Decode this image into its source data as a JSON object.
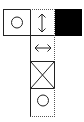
{
  "diagram": {
    "cells": [
      {
        "id": "left",
        "icon": "circle-icon",
        "fill": "#ffffff"
      },
      {
        "id": "top-center",
        "icon": "vertical-double-arrow-icon",
        "fill": "#ffffff"
      },
      {
        "id": "right",
        "icon": "none",
        "fill": "#000000"
      },
      {
        "id": "center-2",
        "icon": "horizontal-double-arrow-icon",
        "fill": "#ffffff"
      },
      {
        "id": "center-3",
        "icon": "cross-box-icon",
        "fill": "#ffffff"
      },
      {
        "id": "center-4",
        "icon": "circle-icon",
        "fill": "#ffffff"
      }
    ],
    "colors": {
      "line": "#222222",
      "black": "#000000",
      "background": "#ffffff"
    }
  }
}
